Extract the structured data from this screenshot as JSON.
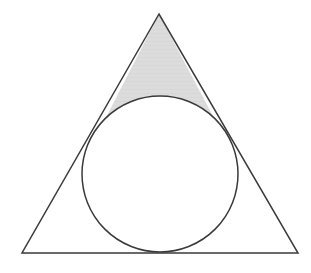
{
  "figure": {
    "title": "Triangle with inscribed circle and shaded apex region",
    "background_color": "#ffffff",
    "stroke_color": "#3a3a3a",
    "stroke_width": 1.5,
    "shade_color": "#dcdcdc",
    "shade_band_color": "#d2d2d2",
    "triangle": {
      "name": "outer-triangle",
      "apex": {
        "x": 159,
        "y": 14
      },
      "bottom_left": {
        "x": 22,
        "y": 253
      },
      "bottom_right": {
        "x": 298,
        "y": 253
      },
      "points": "159,14 22,253 298,253",
      "fill": "none"
    },
    "circle": {
      "name": "inscribed-circle",
      "cx": 160,
      "cy": 174,
      "r": 78,
      "fill": "#ffffff"
    },
    "tangent_points": {
      "left_side": {
        "x": 97,
        "y": 135
      },
      "right_side": {
        "x": 223,
        "y": 135
      },
      "base": {
        "x": 160,
        "y": 252
      }
    },
    "shaded_region": {
      "name": "apex-shaded-region",
      "description": "Curvilinear triangle bounded by the two upper sides of the triangle and the upper arc of the inscribed circle",
      "path": "M 159 14 L 97 135 A 78 78 0 0 0 223 135 Z"
    }
  }
}
